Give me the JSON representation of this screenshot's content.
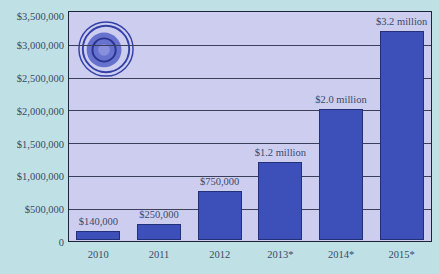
{
  "chart_data": {
    "type": "bar",
    "title": "",
    "xlabel": "",
    "ylabel": "",
    "categories": [
      "2010",
      "2011",
      "2012",
      "2013*",
      "2014*",
      "2015*"
    ],
    "values": [
      140000,
      250000,
      750000,
      1200000,
      2000000,
      3200000
    ],
    "data_labels": [
      "$140,000",
      "$250,000",
      "$750,000",
      "$1.2 million",
      "$2.0 million",
      "$3.2 million"
    ],
    "ylim": [
      0,
      3500000
    ],
    "yticks": [
      0,
      500000,
      1000000,
      1500000,
      2000000,
      2500000,
      3000000,
      3500000
    ],
    "ytick_labels": [
      "0",
      "$500,000",
      "$1,000,000",
      "$1,500,000",
      "$2,000,000",
      "$2,500,000",
      "$3,000,000",
      "$3,500,000"
    ],
    "grid": true,
    "legend": null,
    "colors": {
      "bar": "#3d4fb8",
      "plot_background": "#cdcdf0",
      "page_background": "#bfe0e4",
      "gridline": "#3a3f5a"
    }
  },
  "decoration": {
    "logo": "swirl-globe-logo"
  }
}
